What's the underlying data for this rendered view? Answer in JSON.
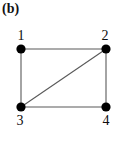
{
  "figure": {
    "panel_label": "(b)",
    "background_color": "#ffffff",
    "width": 117,
    "height": 150
  },
  "style": {
    "node_color": "#000000",
    "node_radius": 4.6,
    "edge_color": "#595959",
    "edge_width": 1.1,
    "label_color": "#0d0d0d"
  },
  "chart_data": {
    "type": "diagram",
    "title": "(b)",
    "diagram_kind": "undirected-graph",
    "nodes": [
      {
        "id": "1",
        "label": "1",
        "x": 21,
        "y": 49,
        "label_x": 21,
        "label_y": 29,
        "label_pos": "above"
      },
      {
        "id": "2",
        "label": "2",
        "x": 106,
        "y": 49,
        "label_x": 105,
        "label_y": 29,
        "label_pos": "above"
      },
      {
        "id": "3",
        "label": "3",
        "x": 21,
        "y": 107,
        "label_x": 20,
        "label_y": 114,
        "label_pos": "below"
      },
      {
        "id": "4",
        "label": "4",
        "x": 106,
        "y": 107,
        "label_x": 106,
        "label_y": 114,
        "label_pos": "below"
      }
    ],
    "edges": [
      {
        "from": "1",
        "to": "2",
        "name": "edge-1-2",
        "kind": "top"
      },
      {
        "from": "1",
        "to": "3",
        "name": "edge-1-3",
        "kind": "left"
      },
      {
        "from": "3",
        "to": "4",
        "name": "edge-3-4",
        "kind": "bottom"
      },
      {
        "from": "2",
        "to": "4",
        "name": "edge-2-4",
        "kind": "right"
      },
      {
        "from": "3",
        "to": "2",
        "name": "edge-3-2",
        "kind": "diagonal"
      }
    ],
    "node_count": 4,
    "edge_count": 5
  }
}
